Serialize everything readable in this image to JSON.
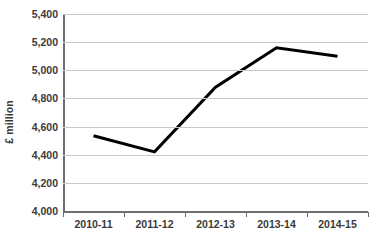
{
  "chart_data": {
    "type": "line",
    "title": "",
    "subtitle": "",
    "xlabel": "",
    "ylabel": "£ million",
    "categories": [
      "2010-11",
      "2011-12",
      "2012-13",
      "2013-14",
      "2014-15"
    ],
    "series": [
      {
        "name": "£ million",
        "values": [
          4535,
          4420,
          4880,
          5160,
          5100
        ]
      }
    ],
    "ylim": [
      4000,
      5400
    ],
    "y_ticks": [
      4000,
      4200,
      4400,
      4600,
      4800,
      5000,
      5200,
      5400
    ],
    "y_tick_labels": [
      "4,000",
      "4,200",
      "4,400",
      "4,600",
      "4,800",
      "5,000",
      "5,200",
      "5,400"
    ],
    "grid": true,
    "grid_axis": "y",
    "legend": false,
    "legend_position": "none",
    "markers": false,
    "line_color": "#000000",
    "line_width": 3,
    "gridline_color": "#c9c9c9",
    "axis_color": "#6e6e6e",
    "text_color": "#3a3a3a",
    "background_color": "#ffffff"
  },
  "axes": {
    "y_title": "£ million"
  }
}
